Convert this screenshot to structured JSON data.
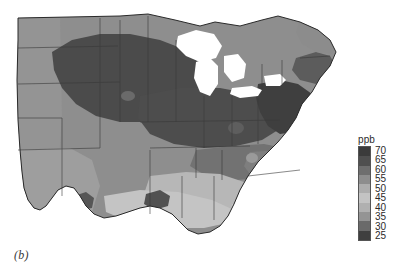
{
  "figure": {
    "panel_label": "(b)",
    "background_color": "#ffffff"
  },
  "legend": {
    "title": "ppb",
    "orientation": "vertical",
    "ticks": [
      "70",
      "65",
      "60",
      "55",
      "50",
      "45",
      "40",
      "35",
      "30",
      "25"
    ],
    "swatch_colors": [
      "#3b3b3b",
      "#4f4f4f",
      "#6e6e6e",
      "#8d8d8d",
      "#adadad",
      "#c3c3c3",
      "#b0b0b0",
      "#949494",
      "#6a6a6a",
      "#3f3f3f"
    ]
  },
  "chart_data": {
    "type": "heatmap",
    "title": "",
    "subtitle": "",
    "xlabel": "",
    "ylabel": "",
    "units": "ppb",
    "colorbar_label": "ppb",
    "colorbar_ticks": [
      70,
      65,
      60,
      55,
      50,
      45,
      40,
      35,
      30,
      25
    ],
    "value_range": [
      25,
      70
    ],
    "grid": false,
    "legend_position": "right",
    "projection_region": "Eastern and Central United States",
    "map_colors": {
      "ocean": "#ffffff",
      "lakes": "#ffffff",
      "border_line": "#2a2a2a",
      "state_line": "#3a3a3a"
    },
    "regions": [
      {
        "name": "Upper Midwest core (IA, IL, WI, MN, NE)",
        "value": 68,
        "color": "#494949"
      },
      {
        "name": "Great Lakes industrial belt (IN, OH, MI, lower)",
        "value": 67,
        "color": "#4a4a4a"
      },
      {
        "name": "Mid-Atlantic corridor (PA, NJ, MD, DE)",
        "value": 69,
        "color": "#3e3e3e"
      },
      {
        "name": "Southern New England (CT, RI, MA coast)",
        "value": 64,
        "color": "#5a5a5a"
      },
      {
        "name": "Northern New England (ME, NH, VT)",
        "value": 56,
        "color": "#8a8a8a"
      },
      {
        "name": "Appalachians (WV, VA, KY, TN)",
        "value": 60,
        "color": "#6f6f6f"
      },
      {
        "name": "Carolinas Piedmont",
        "value": 58,
        "color": "#7c7c7c"
      },
      {
        "name": "Great Plains (KS, OK, ND, SD)",
        "value": 55,
        "color": "#8f8f8f"
      },
      {
        "name": "Texas interior",
        "value": 52,
        "color": "#9d9d9d"
      },
      {
        "name": "Gulf Coast (LA, MS, AL)",
        "value": 44,
        "color": "#c0c0c0"
      },
      {
        "name": "Houston / New Orleans urban plumes",
        "value": 66,
        "color": "#505050"
      },
      {
        "name": "Florida peninsula",
        "value": 40,
        "color": "#c8c8c8"
      },
      {
        "name": "Deep South interior (GA, AL)",
        "value": 47,
        "color": "#b6b6b6"
      }
    ]
  }
}
